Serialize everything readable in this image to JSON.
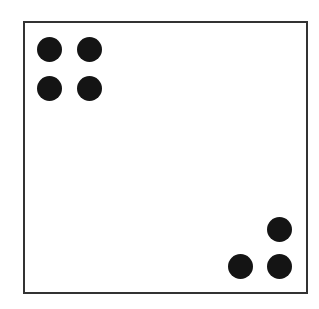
{
  "diagram": {
    "frame": {
      "stroke": "#333333",
      "background": "#ffffff"
    },
    "dot_color": "#141414",
    "groups": [
      {
        "name": "top-left-group",
        "count": 4,
        "dots": [
          {
            "cx": 49,
            "cy": 49
          },
          {
            "cx": 89,
            "cy": 49
          },
          {
            "cx": 49,
            "cy": 88
          },
          {
            "cx": 89,
            "cy": 88
          }
        ]
      },
      {
        "name": "bottom-right-group",
        "count": 3,
        "dots": [
          {
            "cx": 279,
            "cy": 229
          },
          {
            "cx": 240,
            "cy": 266
          },
          {
            "cx": 279,
            "cy": 266
          }
        ]
      }
    ]
  }
}
